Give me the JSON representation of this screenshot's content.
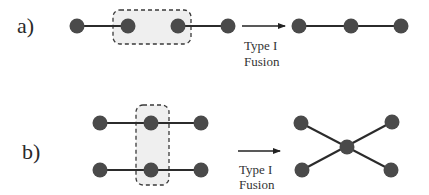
{
  "colors": {
    "node": "#4a4a4a",
    "edge": "#2b2b2b",
    "box_fill": "#efefef",
    "box_stroke": "#3a3a3a",
    "arrow": "#222222",
    "text": "#2a2a2a"
  },
  "panel_a": {
    "label": "a)",
    "arrow_caption_line1": "Type I",
    "arrow_caption_line2": "Fusion",
    "before": {
      "nodes": 4,
      "description": "Linear chain of 4 nodes; middle two nodes enclosed in dashed box (no edge between them)"
    },
    "after": {
      "nodes": 3,
      "description": "Linear chain of 3 nodes"
    }
  },
  "panel_b": {
    "label": "b)",
    "arrow_caption_line1": "Type I",
    "arrow_caption_line2": "Fusion",
    "before": {
      "nodes": 6,
      "description": "Two parallel chains of 3 nodes; middle nodes enclosed in vertical dashed box"
    },
    "after": {
      "nodes": 5,
      "description": "Star/X shape with central node connected to 4 outer nodes"
    }
  }
}
